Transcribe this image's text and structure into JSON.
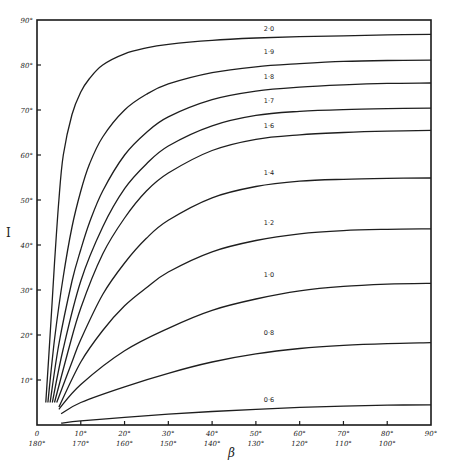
{
  "chart_data": {
    "type": "line",
    "title": "",
    "xlabel": "β",
    "ylabel": "I",
    "xlim": [
      0,
      90
    ],
    "ylim": [
      0,
      90
    ],
    "grid": false,
    "legend": "none (curves labelled inline)",
    "x_ticks": [
      {
        "value": 0,
        "top": "0",
        "bottom": "180°"
      },
      {
        "value": 10,
        "top": "10°",
        "bottom": "170°"
      },
      {
        "value": 20,
        "top": "20°",
        "bottom": "160°"
      },
      {
        "value": 30,
        "top": "30°",
        "bottom": "150°"
      },
      {
        "value": 40,
        "top": "40°",
        "bottom": "140°"
      },
      {
        "value": 50,
        "top": "50°",
        "bottom": "130°"
      },
      {
        "value": 60,
        "top": "60°",
        "bottom": "120°"
      },
      {
        "value": 70,
        "top": "70°",
        "bottom": "110°"
      },
      {
        "value": 80,
        "top": "80°",
        "bottom": "100°"
      },
      {
        "value": 90,
        "top": "90°",
        "bottom": ""
      }
    ],
    "y_ticks": [
      {
        "value": 10,
        "label": "10°"
      },
      {
        "value": 20,
        "label": "20°"
      },
      {
        "value": 30,
        "label": "30°"
      },
      {
        "value": 40,
        "label": "40°"
      },
      {
        "value": 50,
        "label": "50°"
      },
      {
        "value": 60,
        "label": "60°"
      },
      {
        "value": 70,
        "label": "70°"
      },
      {
        "value": 80,
        "label": "80°"
      },
      {
        "value": 90,
        "label": "90°"
      }
    ],
    "series": [
      {
        "name": "2·0",
        "label_at": [
          53,
          87.5
        ],
        "x": [
          2,
          3,
          4,
          5,
          6,
          8,
          10,
          12,
          15,
          20,
          25,
          30,
          40,
          50,
          60,
          70,
          80,
          90
        ],
        "y": [
          5,
          20,
          36,
          50,
          60,
          69,
          74,
          77,
          80,
          82.5,
          83.8,
          84.6,
          85.5,
          86.0,
          86.3,
          86.5,
          86.7,
          86.8
        ]
      },
      {
        "name": "1·9",
        "label_at": [
          53,
          82.5
        ],
        "x": [
          2.5,
          4,
          6,
          8,
          10,
          12,
          15,
          20,
          25,
          30,
          40,
          50,
          60,
          70,
          80,
          90
        ],
        "y": [
          5,
          19,
          33,
          44,
          52,
          58,
          64,
          70,
          73.5,
          75.8,
          78.3,
          79.6,
          80.3,
          80.8,
          81.0,
          81.1
        ]
      },
      {
        "name": "1·8",
        "label_at": [
          53,
          77
        ],
        "x": [
          3,
          5,
          8,
          10,
          12,
          15,
          20,
          25,
          30,
          40,
          50,
          60,
          70,
          80,
          90
        ],
        "y": [
          5,
          18,
          32,
          39,
          45,
          52,
          60,
          65,
          68.5,
          72.3,
          74.2,
          75.1,
          75.6,
          75.9,
          76.0
        ]
      },
      {
        "name": "1·7",
        "label_at": [
          53,
          71.5
        ],
        "x": [
          3.5,
          6,
          10,
          15,
          20,
          25,
          30,
          40,
          50,
          60,
          70,
          80,
          90
        ],
        "y": [
          5,
          17,
          32,
          44,
          52.5,
          58,
          62,
          66.5,
          68.8,
          69.7,
          70.1,
          70.3,
          70.4
        ]
      },
      {
        "name": "1·6",
        "label_at": [
          53,
          66
        ],
        "x": [
          4,
          7,
          10,
          15,
          20,
          25,
          30,
          40,
          50,
          60,
          70,
          80,
          90
        ],
        "y": [
          5,
          16,
          26,
          38,
          46,
          52,
          56,
          61,
          63.5,
          64.5,
          65.0,
          65.3,
          65.5
        ]
      },
      {
        "name": "1·4",
        "label_at": [
          53,
          55.5
        ],
        "x": [
          4.5,
          8,
          10,
          15,
          20,
          25,
          30,
          40,
          50,
          60,
          70,
          80,
          90
        ],
        "y": [
          5,
          14,
          19,
          29,
          36,
          41.5,
          45.5,
          50.5,
          53,
          54.2,
          54.6,
          54.8,
          54.9
        ]
      },
      {
        "name": "1·2",
        "label_at": [
          53,
          44.5
        ],
        "x": [
          5,
          10,
          15,
          20,
          25,
          30,
          40,
          50,
          60,
          70,
          80,
          90
        ],
        "y": [
          4,
          14,
          21,
          26.5,
          30.5,
          34,
          38.5,
          41,
          42.5,
          43.2,
          43.5,
          43.6
        ]
      },
      {
        "name": "1·0",
        "label_at": [
          53,
          33
        ],
        "x": [
          5,
          10,
          20,
          30,
          40,
          50,
          60,
          70,
          80,
          90
        ],
        "y": [
          3.5,
          9,
          16.5,
          21.5,
          25.5,
          28,
          29.8,
          30.8,
          31.3,
          31.5
        ]
      },
      {
        "name": "0·8",
        "label_at": [
          53,
          20
        ],
        "x": [
          5.5,
          10,
          20,
          30,
          40,
          50,
          60,
          70,
          80,
          90
        ],
        "y": [
          2.5,
          5,
          8.5,
          11.5,
          14,
          15.8,
          17,
          17.7,
          18.1,
          18.3
        ]
      },
      {
        "name": "0·6",
        "label_at": [
          53,
          5.2
        ],
        "x": [
          5.5,
          10,
          20,
          30,
          40,
          50,
          60,
          70,
          80,
          90
        ],
        "y": [
          0.4,
          0.9,
          1.7,
          2.4,
          3.0,
          3.5,
          3.9,
          4.2,
          4.4,
          4.5
        ]
      }
    ]
  }
}
